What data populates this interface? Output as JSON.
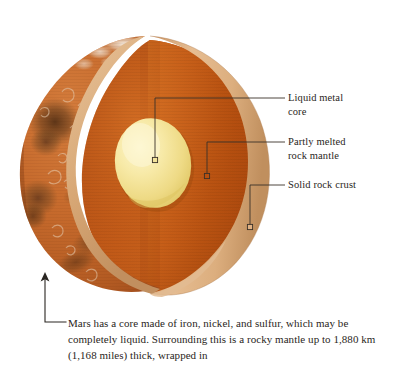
{
  "figure": {
    "planet_surface_name": "mars-surface",
    "cutaway_name": "mars-cutaway-wedge"
  },
  "callouts": [
    {
      "id": "liquid-metal-core",
      "label": "Liquid metal\ncore",
      "target": "core"
    },
    {
      "id": "partly-melted-rock-mantle",
      "label": "Partly melted\nrock mantle",
      "target": "mantle"
    },
    {
      "id": "solid-rock-crust",
      "label": "Solid rock crust",
      "target": "crust"
    }
  ],
  "caption": {
    "text": "Mars has a core made of iron, nickel, and sulfur, which may be completely liquid. Surrounding this is a rocky mantle up to 1,880 km (1,168 miles) thick, wrapped in"
  },
  "layers": {
    "core": {
      "name": "Liquid metal core",
      "color": "#f3e39a",
      "highlight": "#faf0c0",
      "shadow": "#e3cd72"
    },
    "mantle": {
      "name": "Partly melted rock mantle",
      "color": "#c05a18",
      "inner": "#b8500f",
      "outer": "#d2661c"
    },
    "crust": {
      "name": "Solid rock crust",
      "color": "#e0b183",
      "edge": "#cf9a66"
    },
    "surface": {
      "name": "Mars surface terrain",
      "color": "#c8662a",
      "dark_patch": "#5a3318",
      "light_patch": "#e6ddd2",
      "polar_cap": "#f2ece4"
    }
  },
  "leader_lines": {
    "color": "#3a3128",
    "marker": "square"
  },
  "caption_arrow": {
    "name": "caption-pointer-arrow",
    "color": "#2a2622"
  }
}
